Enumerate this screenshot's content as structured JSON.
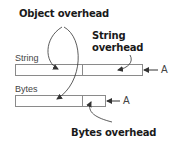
{
  "annotations": {
    "object_overhead": "Object overhead",
    "string_overhead_line1": "String",
    "string_overhead_line2": "overhead",
    "bytes_overhead": "Bytes overhead"
  },
  "rows": [
    {
      "label": "String",
      "pointer": "A"
    },
    {
      "label": "Bytes",
      "pointer": "A"
    }
  ],
  "colors": {
    "box_stroke": "#8a8a8a",
    "arrow": "#333333",
    "text_bold": "#1a1a1a"
  }
}
